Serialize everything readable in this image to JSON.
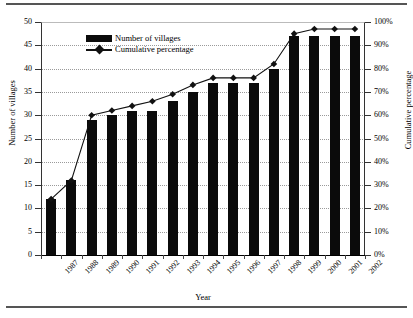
{
  "chart_data": {
    "type": "bar",
    "title": "",
    "xlabel": "Year",
    "ylabel": "Number of villages",
    "y2label": "Cumulative percentage",
    "categories": [
      "1987",
      "1988",
      "1989",
      "1990",
      "1991",
      "1992",
      "1993",
      "1994",
      "1995",
      "1996",
      "1997",
      "1998",
      "1999",
      "2000",
      "2001",
      "2002"
    ],
    "series": [
      {
        "name": "Number of villages",
        "type": "bar",
        "axis": "left",
        "values": [
          12,
          16,
          29,
          30,
          31,
          31,
          33,
          35,
          37,
          37,
          37,
          40,
          47,
          47,
          47,
          47
        ]
      },
      {
        "name": "Cumulative percentage",
        "type": "line",
        "axis": "right",
        "values": [
          24,
          32,
          60,
          62,
          64,
          66,
          69,
          73,
          76,
          76,
          76,
          82,
          95,
          97,
          97,
          97
        ]
      }
    ],
    "ylim": [
      0,
      50
    ],
    "yticks": [
      0,
      5,
      10,
      15,
      20,
      25,
      30,
      35,
      40,
      45,
      50
    ],
    "ytick_labels": [
      "0",
      "5",
      "10",
      "15",
      "20",
      "25",
      "30",
      "35",
      "40",
      "45",
      "50"
    ],
    "y2lim": [
      0,
      100
    ],
    "y2ticks": [
      0,
      10,
      20,
      30,
      40,
      50,
      60,
      70,
      80,
      90,
      100
    ],
    "y2tick_labels": [
      "0%",
      "10%",
      "20%",
      "30%",
      "40%",
      "50%",
      "60%",
      "70%",
      "80%",
      "90%",
      "100%"
    ],
    "grid": true,
    "grid_style": "dotted-horizontal",
    "legend": {
      "position": "top-left-inside",
      "entries": [
        {
          "label": "Number of villages",
          "marker": "bar-swatch",
          "color": "#0b0b0b"
        },
        {
          "label": "Cumulative percentage",
          "marker": "line-diamond",
          "color": "#111111"
        }
      ]
    },
    "colors": {
      "bar": "#0b0b0b",
      "line": "#111111",
      "grid": "#9a9a9a",
      "axis": "#333333",
      "background": "#ffffff"
    }
  }
}
